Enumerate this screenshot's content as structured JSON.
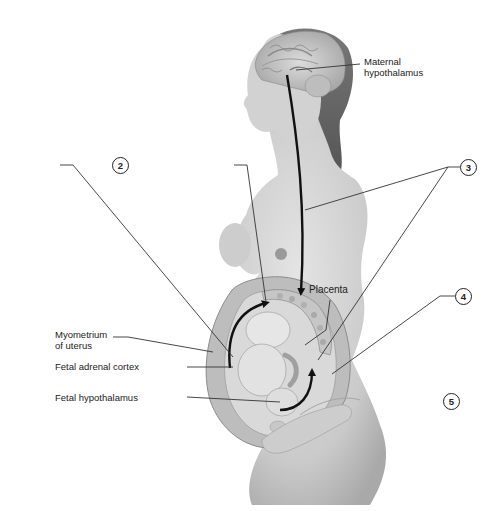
{
  "diagram": {
    "type": "anatomical-illustration"
  },
  "labels": {
    "maternal_hypothalamus_line1": "Maternal",
    "maternal_hypothalamus_line2": "hypothalamus",
    "placenta": "Placenta",
    "myometrium_line1": "Myometrium",
    "myometrium_line2": "of uterus",
    "fetal_adrenal_cortex": "Fetal adrenal cortex",
    "fetal_hypothalamus": "Fetal hypothalamus"
  },
  "callouts": [
    {
      "id": "2",
      "label": "2"
    },
    {
      "id": "3",
      "label": "3"
    },
    {
      "id": "4",
      "label": "4"
    },
    {
      "id": "5",
      "label": "5"
    }
  ],
  "colors": {
    "skin": "#cfcfcf",
    "skin_dark": "#a8a8a8",
    "hair": "#6a6a6a",
    "arrow": "#111111",
    "leader": "#333333",
    "background": "#ffffff"
  }
}
